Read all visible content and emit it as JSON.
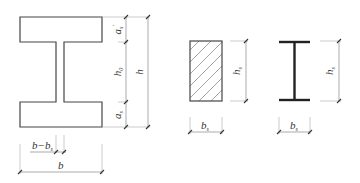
{
  "figure": {
    "sections": [
      {
        "id": "i-section",
        "shape": "I-shaped composite section",
        "dimensions": {
          "a_s_prime": {
            "symbol": "a",
            "sub": "s",
            "prime": "′"
          },
          "h0": {
            "symbol": "h",
            "sub": "0"
          },
          "a_s": {
            "symbol": "a",
            "sub": "s"
          },
          "h": {
            "symbol": "h"
          },
          "b_minus_bs": {
            "symbol": "b−b",
            "sub": "s"
          },
          "b": {
            "symbol": "b"
          }
        }
      },
      {
        "id": "rect-section",
        "shape": "hatched rectangular concrete section",
        "dimensions": {
          "hs": {
            "symbol": "h",
            "sub": "s"
          },
          "bs": {
            "symbol": "b",
            "sub": "s"
          }
        }
      },
      {
        "id": "steel-i-section",
        "shape": "steel I-beam section",
        "dimensions": {
          "hs": {
            "symbol": "h",
            "sub": "s"
          },
          "bs": {
            "symbol": "b",
            "sub": "s"
          }
        }
      }
    ],
    "colors": {
      "outline": "#444444",
      "dimension": "#888888",
      "background": "#ffffff"
    }
  }
}
